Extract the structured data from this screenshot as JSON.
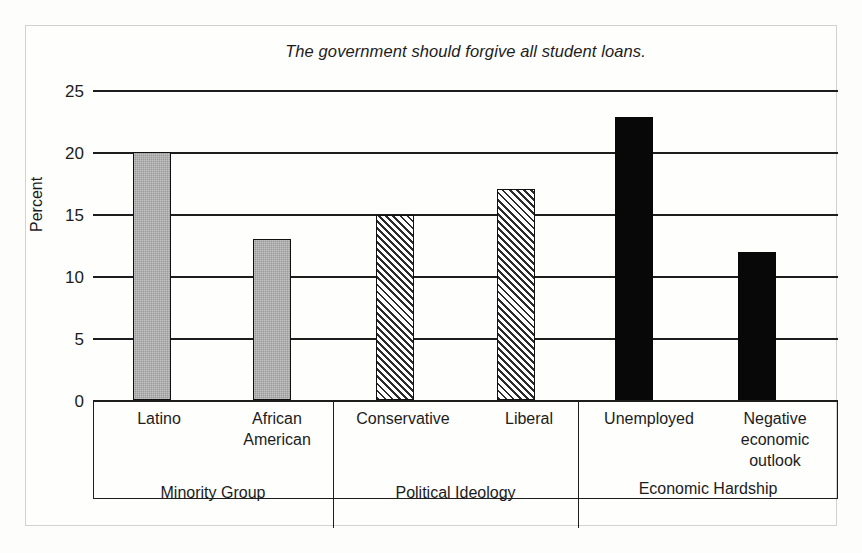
{
  "chart_data": {
    "type": "bar",
    "title": "The government should forgive all student loans.",
    "xlabel": "",
    "ylabel": "Percent",
    "ylim": [
      0,
      25
    ],
    "yticks": [
      0,
      5,
      10,
      15,
      20,
      25
    ],
    "grid": true,
    "legend": "none",
    "categories": [
      "Latino",
      "African American",
      "Conservative",
      "Liberal",
      "Unemployed",
      "Negative economic outlook"
    ],
    "values": [
      20,
      13,
      14.9,
      17,
      22.8,
      11.9
    ],
    "groups": [
      {
        "label": "Minority Group",
        "style": "solid-gray",
        "categories": [
          "Latino",
          "African American"
        ],
        "values": [
          20,
          13
        ]
      },
      {
        "label": "Political Ideology",
        "style": "diagonal-hatch",
        "categories": [
          "Conservative",
          "Liberal"
        ],
        "values": [
          14.9,
          17
        ]
      },
      {
        "label": "Economic Hardship",
        "style": "solid-black",
        "categories": [
          "Unemployed",
          "Negative economic outlook"
        ],
        "values": [
          22.8,
          11.9
        ]
      }
    ]
  },
  "axis": {
    "ylabel": "Percent",
    "ticks": {
      "t25": "25",
      "t20": "20",
      "t15": "15",
      "t10": "10",
      "t5": "5",
      "t0": "0"
    }
  },
  "categories": {
    "latino": "Latino",
    "african_american": "African\nAmerican",
    "african_american_line1": "African",
    "african_american_line2": "American",
    "conservative": "Conservative",
    "liberal": "Liberal",
    "unemployed": "Unemployed",
    "negative_line1": "Negative",
    "negative_line2": "economic",
    "negative_line3": "outlook"
  },
  "groups": {
    "minority": "Minority Group",
    "political": "Political Ideology",
    "economic": "Economic Hardship"
  },
  "colors": {
    "gray_bar": "#9a9a9a",
    "black_bar": "#080808",
    "hatch_stroke": "#2b2b2b",
    "axis": "#1d1d1d",
    "text": "#1c1c1c",
    "page_border": "#d3d2cf"
  }
}
